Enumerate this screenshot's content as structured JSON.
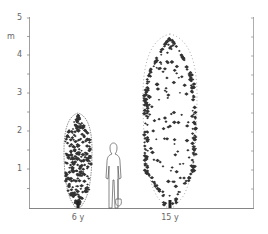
{
  "figure": {
    "unit_label": "m",
    "y_axis": {
      "ticks": [
        {
          "value": "1",
          "y": 169
        },
        {
          "value": "2",
          "y": 131
        },
        {
          "value": "3",
          "y": 93
        },
        {
          "value": "4",
          "y": 55
        },
        {
          "value": "5",
          "y": 18
        }
      ]
    },
    "plants": [
      {
        "id": "young",
        "label": "6 y",
        "height_m": 2.5,
        "center_x": 78
      },
      {
        "id": "mature",
        "label": "15 y",
        "height_m": 4.6,
        "center_x": 170
      }
    ],
    "scale_figure": {
      "label": "person with spade",
      "height_m": 1.7
    },
    "colors": {
      "axis": "#888888",
      "foliage": "#333333",
      "outline": "#666666"
    }
  }
}
